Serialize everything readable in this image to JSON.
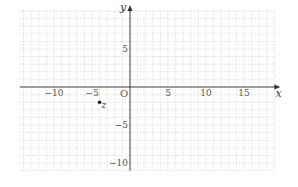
{
  "diagram": {
    "type": "coordinate-plane",
    "x_axis": {
      "label": "x",
      "range": [
        -14.5,
        19
      ],
      "tick_labels": [
        "−10",
        "−5",
        "5",
        "10",
        "15"
      ],
      "ticks": [
        -10,
        -5,
        5,
        10,
        15
      ]
    },
    "y_axis": {
      "label": "y",
      "range": [
        -11,
        10
      ],
      "tick_labels": [
        "5",
        "−5",
        "−10"
      ],
      "ticks": [
        5,
        -5,
        -10
      ]
    },
    "origin_label": "O",
    "grid": {
      "spacing": 1,
      "style": "dashed",
      "color": "#c8c8c8"
    },
    "points": [
      {
        "name": "z",
        "label": "z",
        "x": -4,
        "y": -2
      }
    ],
    "colors": {
      "axis": "#444444",
      "grid": "#c8c8c8",
      "point": "#111111"
    }
  }
}
